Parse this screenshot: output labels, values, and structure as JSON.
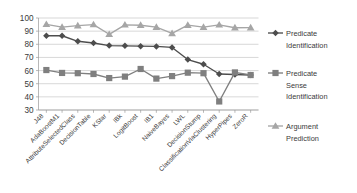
{
  "chart_data": {
    "type": "line",
    "title": "",
    "xlabel": "",
    "ylabel": "",
    "ylim": [
      30,
      100
    ],
    "ytick_step": 10,
    "yticks": [
      30,
      40,
      50,
      60,
      70,
      80,
      90,
      100
    ],
    "grid": true,
    "legend_position": "right",
    "categories": [
      "J48",
      "AdaBoostM1",
      "AttributeSelectedClass",
      "DecisionTable",
      "KStar",
      "IBk",
      "LogitBoost",
      "IB1",
      "NaiveBayes",
      "LWL",
      "DecisionStump",
      "ClassificationViaClustering",
      "HyperPipes",
      "ZeroR"
    ],
    "series": [
      {
        "name": "Predicate Identification",
        "marker": "diamond",
        "color": "#4d4d4d",
        "values": [
          86.5,
          86.5,
          82.3,
          81.0,
          79.0,
          78.8,
          78.6,
          78.4,
          77.6,
          68.4,
          64.8,
          57.4,
          57.0,
          56.6
        ]
      },
      {
        "name": "Predicate Sense Identification",
        "marker": "square",
        "color": "#7f7f7f",
        "values": [
          60.4,
          58.2,
          58.0,
          57.4,
          54.3,
          55.4,
          61.2,
          53.9,
          55.8,
          58.4,
          58.0,
          36.5,
          58.6,
          56.6
        ]
      },
      {
        "name": "Argument Prediction",
        "marker": "triangle",
        "color": "#a6a6a6",
        "values": [
          95.2,
          93.0,
          94.2,
          95.0,
          87.6,
          94.8,
          94.5,
          93.0,
          88.3,
          94.6,
          93.0,
          94.8,
          92.6,
          92.7
        ]
      }
    ]
  },
  "legend": {
    "items": [
      {
        "label_line1": "Predicate",
        "label_line2": "Identification",
        "label_line3": ""
      },
      {
        "label_line1": "Predicate",
        "label_line2": "Sense",
        "label_line3": "Identification"
      },
      {
        "label_line1": "Argument",
        "label_line2": "Prediction",
        "label_line3": ""
      }
    ]
  }
}
